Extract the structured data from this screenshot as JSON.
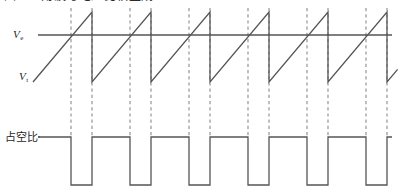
{
  "figure": {
    "caption_top": "图4 三角波与电压比较生成PWM",
    "labels": {
      "ve": "V",
      "ve_sub": "e",
      "vt": "V",
      "vt_sub": "t",
      "duty_cycle": "占空比"
    },
    "colors": {
      "waveform": "#555555",
      "dashed": "#8a8a8a",
      "background": "#ffffff"
    }
  },
  "chart_data": {
    "type": "line",
    "title": "图4 三角波与电压比较生成PWM",
    "xlabel": "",
    "ylabel": "",
    "grid": false,
    "legend": "none",
    "xlim": [
      0,
      400
    ],
    "annotations": [
      {
        "text": "V",
        "sub": "e",
        "x": 13,
        "y": 35,
        "meaning": "comparator reference level line"
      },
      {
        "text": "V",
        "sub": "t",
        "x": 19,
        "y": 77,
        "meaning": "sawtooth (triangle) carrier wave"
      },
      {
        "text": "占空比",
        "x": 5,
        "y": 137,
        "meaning": "duty cycle output pulse train"
      }
    ],
    "series": [
      {
        "name": "Ve",
        "kind": "horizontal-reference",
        "y_pixel": 35,
        "x_start": 38,
        "x_end": 392,
        "color": "#555555"
      },
      {
        "name": "Vt",
        "kind": "sawtooth",
        "color": "#555555",
        "period_px": 59,
        "peak_y_pixel": 12,
        "trough_y_pixel": 82,
        "ramp_start_x": 33,
        "cycles": 6,
        "reset_x_positions": [
          92,
          151,
          210,
          269,
          328,
          387
        ],
        "crossing_x_positions": [
          71,
          130,
          189,
          248,
          307,
          366
        ]
      },
      {
        "name": "PWM",
        "kind": "pulse-train",
        "color": "#555555",
        "high_y_pixel": 137,
        "low_y_pixel": 185,
        "x_start": 38,
        "x_end": 392,
        "pulses": [
          {
            "low_start": 71,
            "low_end": 92
          },
          {
            "low_start": 130,
            "low_end": 151
          },
          {
            "low_start": 189,
            "low_end": 210
          },
          {
            "low_start": 248,
            "low_end": 269
          },
          {
            "low_start": 307,
            "low_end": 328
          },
          {
            "low_start": 366,
            "low_end": 387
          }
        ]
      }
    ],
    "dashed_guides": {
      "color": "#8a8a8a",
      "y_top": 8,
      "y_bottom": 137,
      "x_positions": [
        71,
        92,
        130,
        151,
        189,
        210,
        248,
        269,
        307,
        328,
        366,
        387
      ]
    }
  }
}
